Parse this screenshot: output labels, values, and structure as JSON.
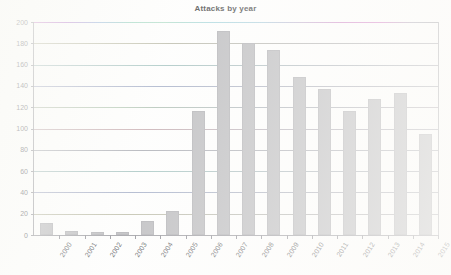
{
  "chart_data": {
    "type": "bar",
    "title": "Attacks by year",
    "xlabel": "",
    "ylabel": "",
    "categories": [
      "2000",
      "2001",
      "2002",
      "2003",
      "2004",
      "2005",
      "2006",
      "2007",
      "2008",
      "2009",
      "2010",
      "2011",
      "2012",
      "2013",
      "2014",
      "2015"
    ],
    "values": [
      11,
      4,
      3,
      3,
      13,
      23,
      116,
      192,
      180,
      174,
      148,
      137,
      116,
      128,
      133,
      95
    ],
    "ylim": [
      0,
      200
    ],
    "ytick_labels": [
      "0",
      "20",
      "40",
      "60",
      "80",
      "100",
      "120",
      "140",
      "160",
      "180",
      "200"
    ],
    "ytick_values": [
      0,
      20,
      40,
      60,
      80,
      100,
      120,
      140,
      160,
      180,
      200
    ],
    "grid": true,
    "legend": null,
    "series": [
      {
        "name": "Attacks",
        "values": [
          11,
          4,
          3,
          3,
          13,
          23,
          116,
          192,
          180,
          174,
          148,
          137,
          116,
          128,
          133,
          95
        ]
      }
    ],
    "bar_color": "#aeaeb1",
    "axis_color": "#8a8a90",
    "grid_color": "#9ea0a8",
    "text_color": "#303035",
    "background_color": "#fdfdfc"
  }
}
